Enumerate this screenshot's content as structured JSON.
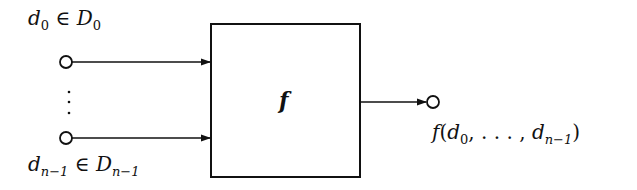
{
  "diagram": {
    "type": "function-block",
    "block": {
      "label": "f"
    },
    "inputs": [
      {
        "var": "d",
        "var_sub": "0",
        "relation": "∈",
        "set": "D",
        "set_sub": "0"
      },
      {
        "var": "d",
        "var_sub": "n−1",
        "relation": "∈",
        "set": "D",
        "set_sub": "n−1"
      }
    ],
    "ellipsis": "⋮",
    "output": {
      "func": "f",
      "open": "(",
      "arg_first": "d",
      "arg_first_sub": "0",
      "sep": ", . . . , ",
      "arg_last": "d",
      "arg_last_sub": "n−1",
      "close": ")"
    },
    "colors": {
      "stroke": "#111111",
      "background": "#ffffff"
    }
  }
}
